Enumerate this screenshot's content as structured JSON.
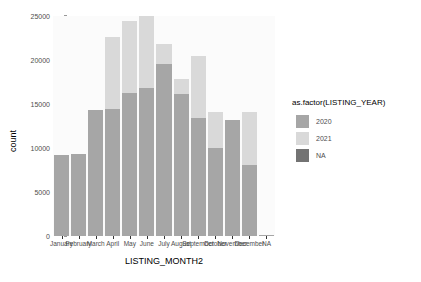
{
  "chart_data": {
    "type": "bar",
    "subtype": "stacked",
    "title": "",
    "xlabel": "LISTING_MONTH2",
    "ylabel": "count",
    "categories": [
      "January",
      "February",
      "March",
      "April",
      "May",
      "June",
      "July",
      "August",
      "September",
      "October",
      "November",
      "December",
      "NA"
    ],
    "series": [
      {
        "name": "2020",
        "color": "#a6a6a6",
        "values": [
          9200,
          9300,
          14300,
          14400,
          16200,
          16800,
          19600,
          16100,
          13400,
          10000,
          13200,
          8100,
          100
        ]
      },
      {
        "name": "2021",
        "color": "#d9d9d9",
        "values": [
          0,
          0,
          0,
          8200,
          8200,
          8200,
          2200,
          1800,
          7100,
          4100,
          0,
          6000,
          0
        ]
      },
      {
        "name": "NA",
        "color": "#737373",
        "values": [
          0,
          0,
          0,
          0,
          0,
          0,
          0,
          0,
          0,
          0,
          0,
          0,
          0
        ]
      }
    ],
    "totals": [
      9200,
      9300,
      14300,
      22600,
      24400,
      25000,
      21800,
      17900,
      20500,
      14100,
      13200,
      14100,
      100
    ],
    "ylim": [
      0,
      25000
    ],
    "yticks": [
      0,
      5000,
      10000,
      15000,
      20000,
      25000
    ],
    "ytick_labels": [
      "0",
      "5000",
      "10000",
      "15000",
      "20000",
      "25000"
    ],
    "grid": false,
    "legend_position": "right",
    "legend_title": "as.factor(LISTING_YEAR)",
    "panel_background": "#fbfbfb"
  },
  "legend": {
    "title": "as.factor(LISTING_YEAR)",
    "entries": [
      {
        "label": "2020",
        "color": "#a6a6a6"
      },
      {
        "label": "2021",
        "color": "#d9d9d9"
      },
      {
        "label": "NA",
        "color": "#737373"
      }
    ]
  },
  "axes": {
    "y_title": "count",
    "x_title": "LISTING_MONTH2"
  }
}
